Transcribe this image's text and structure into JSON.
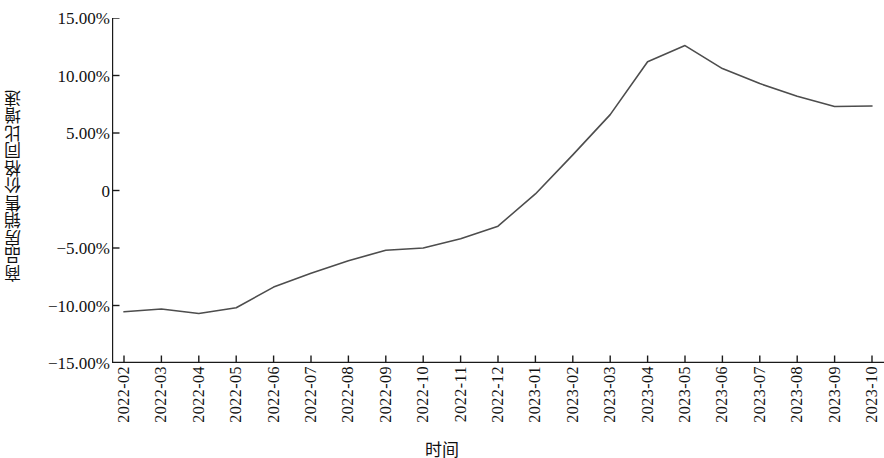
{
  "chart_data": {
    "type": "line",
    "title": "",
    "xlabel": "时间",
    "ylabel": "商品房销售价格同比增速",
    "categories": [
      "2022-02",
      "2022-03",
      "2022-04",
      "2022-05",
      "2022-06",
      "2022-07",
      "2022-08",
      "2022-09",
      "2022-10",
      "2022-11",
      "2022-12",
      "2023-01",
      "2023-02",
      "2023-03",
      "2023-04",
      "2023-05",
      "2023-06",
      "2023-07",
      "2023-08",
      "2023-09",
      "2023-10"
    ],
    "series": [
      {
        "name": "商品房销售价格同比增速",
        "values": [
          -10.55,
          -10.3,
          -10.7,
          -10.2,
          -8.4,
          -7.2,
          -6.1,
          -5.2,
          -5.0,
          -4.2,
          -3.1,
          -0.3,
          3.1,
          6.6,
          11.2,
          12.6,
          10.6,
          9.3,
          8.2,
          7.3,
          7.35
        ],
        "color": "#4d4d4d"
      }
    ],
    "ylim": [
      -15.0,
      15.0
    ],
    "ytick_values": [
      15.0,
      10.0,
      5.0,
      0,
      -5.0,
      -10.0,
      -15.0
    ],
    "ytick_labels": [
      "15.00%",
      "10.00%",
      "5.00%",
      "0",
      "−5.00%",
      "−10.00%",
      "−15.00%"
    ],
    "grid": false,
    "legend": null,
    "legend_position": "none",
    "units": "percent",
    "axis_color": "#1a1a1a",
    "background_color": "#ffffff"
  }
}
